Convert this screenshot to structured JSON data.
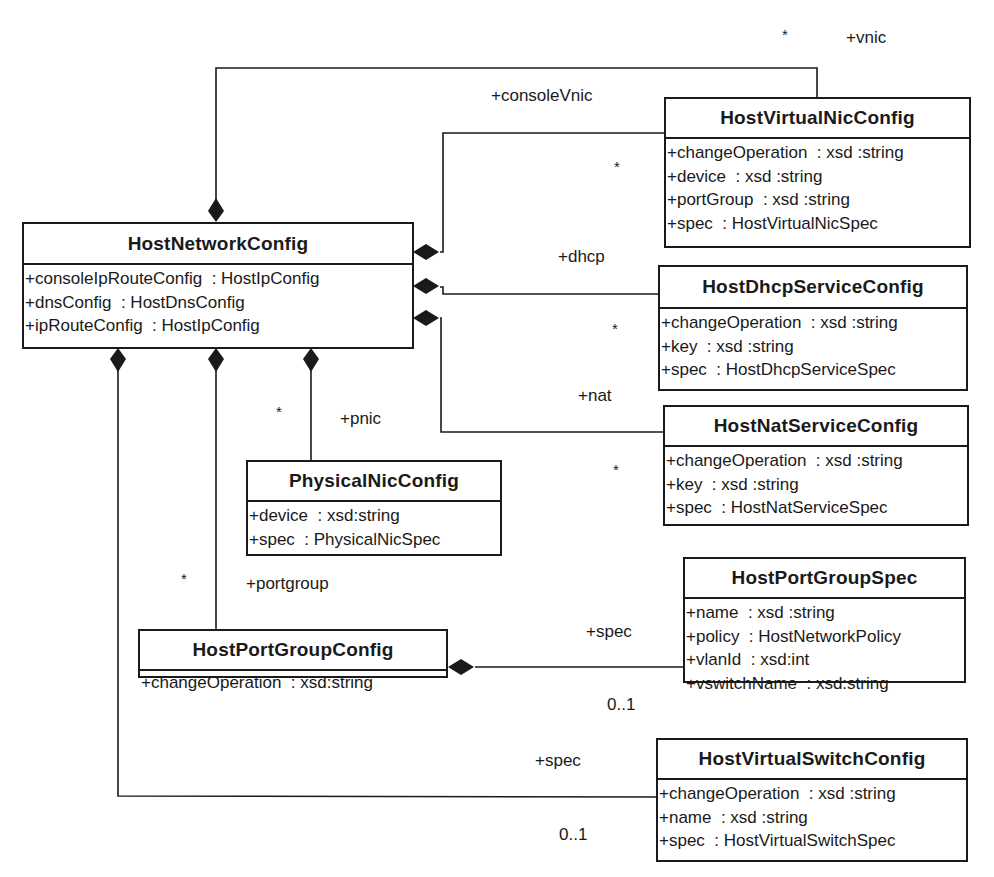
{
  "diagram": {
    "type": "uml-class-diagram",
    "classes": {
      "host_network_config": {
        "name": "HostNetworkConfig",
        "attributes": [
          "+consoleIpRouteConfig  : HostIpConfig",
          "+dnsConfig  : HostDnsConfig",
          "+ipRouteConfig  : HostIpConfig"
        ]
      },
      "host_virtual_nic_config": {
        "name": "HostVirtualNicConfig",
        "attributes": [
          "+changeOperation  : xsd :string",
          "+device  : xsd :string",
          "+portGroup  : xsd :string",
          "+spec  : HostVirtualNicSpec"
        ]
      },
      "host_dhcp_service_config": {
        "name": "HostDhcpServiceConfig",
        "attributes": [
          "+changeOperation  : xsd :string",
          "+key  : xsd :string",
          "+spec  : HostDhcpServiceSpec"
        ]
      },
      "host_nat_service_config": {
        "name": "HostNatServiceConfig",
        "attributes": [
          "+changeOperation  : xsd :string",
          "+key  : xsd :string",
          "+spec  : HostNatServiceSpec"
        ]
      },
      "physical_nic_config": {
        "name": "PhysicalNicConfig",
        "attributes": [
          "+device  : xsd:string",
          "+spec  : PhysicalNicSpec"
        ]
      },
      "host_port_group_spec": {
        "name": "HostPortGroupSpec",
        "attributes": [
          "+name  : xsd :string",
          "+policy  : HostNetworkPolicy",
          "+vlanId  : xsd:int",
          "+vswitchName  : xsd:string"
        ]
      },
      "host_port_group_config": {
        "name": "HostPortGroupConfig",
        "attributes": [
          "+changeOperation  : xsd:string"
        ]
      },
      "host_virtual_switch_config": {
        "name": "HostVirtualSwitchConfig",
        "attributes": [
          "+changeOperation  : xsd :string",
          "+name  : xsd :string",
          "+spec  : HostVirtualSwitchSpec"
        ]
      }
    },
    "associations": {
      "vnic": {
        "role": "+vnic",
        "multiplicity": "*"
      },
      "console_vnic": {
        "role": "+consoleVnic",
        "multiplicity": "*"
      },
      "dhcp": {
        "role": "+dhcp",
        "multiplicity": "*"
      },
      "nat": {
        "role": "+nat",
        "multiplicity": "*"
      },
      "pnic": {
        "role": "+pnic",
        "multiplicity": "*"
      },
      "portgroup": {
        "role": "+portgroup",
        "multiplicity": "*"
      },
      "portgroup_spec": {
        "role": "+spec",
        "multiplicity": "0..1"
      },
      "vswitch_spec": {
        "role": "+spec",
        "multiplicity": "0..1"
      }
    },
    "colors": {
      "line": "#1a1a1a",
      "background": "#ffffff"
    }
  }
}
